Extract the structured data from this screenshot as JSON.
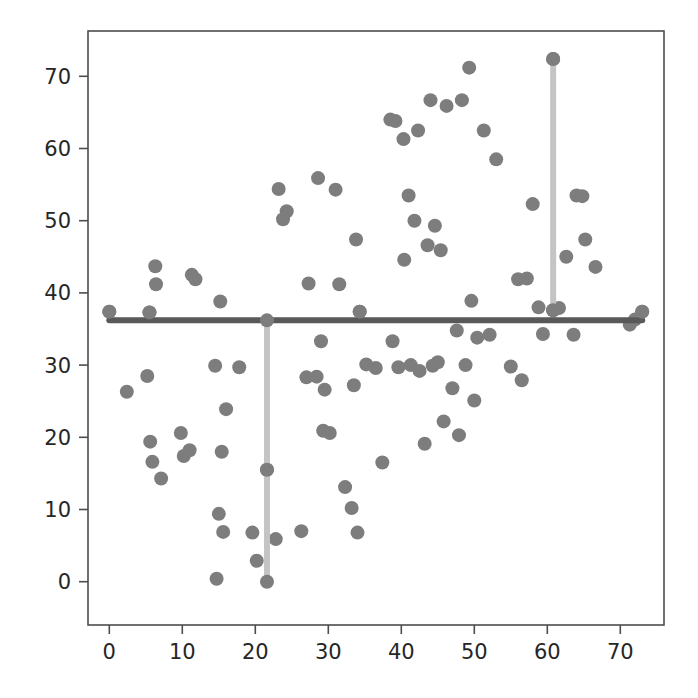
{
  "figure": {
    "background_color": "#ffffff",
    "width": 698,
    "height": 698
  },
  "chart_data": {
    "type": "scatter",
    "title": "",
    "xlabel": "",
    "ylabel": "",
    "xlim": [
      -2.9,
      76.0
    ],
    "ylim": [
      -5.0,
      71.4
    ],
    "grid": false,
    "legend": null,
    "axes": {
      "x_ticks": [
        0,
        10,
        20,
        30,
        40,
        50,
        60,
        70
      ],
      "x_tick_labels": [
        "0",
        "10",
        "20",
        "30",
        "40",
        "50",
        "60",
        "70"
      ],
      "y_ticks": [
        0,
        10,
        20,
        30,
        40,
        50,
        60,
        70
      ],
      "y_tick_labels": [
        "0",
        "10",
        "20",
        "30",
        "40",
        "50",
        "60",
        "70"
      ],
      "spine_color": "#4d4d4d",
      "tick_color": "#4d4d4d",
      "tick_label_color": "#262626"
    },
    "series": [
      {
        "name": "points",
        "marker": "circle",
        "marker_color": "#7d7d7d",
        "marker_size": 14,
        "points": [
          [
            0.0,
            37.4
          ],
          [
            2.4,
            26.3
          ],
          [
            5.2,
            28.5
          ],
          [
            5.5,
            37.3
          ],
          [
            5.6,
            19.4
          ],
          [
            5.9,
            16.6
          ],
          [
            6.3,
            43.7
          ],
          [
            6.4,
            41.2
          ],
          [
            7.1,
            14.3
          ],
          [
            9.8,
            20.6
          ],
          [
            10.2,
            17.4
          ],
          [
            11.0,
            18.2
          ],
          [
            11.3,
            42.5
          ],
          [
            11.8,
            41.9
          ],
          [
            14.5,
            29.9
          ],
          [
            14.7,
            0.4
          ],
          [
            15.0,
            9.4
          ],
          [
            15.2,
            38.8
          ],
          [
            15.4,
            18.0
          ],
          [
            15.6,
            6.9
          ],
          [
            16.0,
            23.9
          ],
          [
            17.8,
            29.7
          ],
          [
            19.6,
            6.8
          ],
          [
            20.2,
            2.9
          ],
          [
            21.6,
            15.5
          ],
          [
            22.8,
            5.9
          ],
          [
            23.2,
            54.4
          ],
          [
            23.8,
            50.2
          ],
          [
            24.3,
            51.3
          ],
          [
            26.3,
            7.0
          ],
          [
            27.0,
            28.3
          ],
          [
            27.3,
            41.3
          ],
          [
            28.4,
            28.4
          ],
          [
            28.6,
            55.9
          ],
          [
            29.0,
            33.3
          ],
          [
            29.3,
            20.9
          ],
          [
            29.5,
            26.6
          ],
          [
            30.2,
            20.6
          ],
          [
            31.0,
            54.3
          ],
          [
            31.5,
            41.2
          ],
          [
            32.3,
            13.1
          ],
          [
            33.2,
            10.2
          ],
          [
            33.5,
            27.2
          ],
          [
            33.8,
            47.4
          ],
          [
            34.0,
            6.8
          ],
          [
            34.3,
            37.4
          ],
          [
            35.2,
            30.1
          ],
          [
            36.5,
            29.6
          ],
          [
            37.4,
            16.5
          ],
          [
            38.5,
            64.0
          ],
          [
            38.8,
            33.3
          ],
          [
            39.2,
            63.8
          ],
          [
            39.6,
            29.7
          ],
          [
            40.3,
            61.3
          ],
          [
            40.4,
            44.6
          ],
          [
            41.0,
            53.5
          ],
          [
            41.3,
            30.0
          ],
          [
            41.8,
            50.0
          ],
          [
            42.3,
            62.5
          ],
          [
            42.5,
            29.2
          ],
          [
            43.2,
            19.1
          ],
          [
            43.6,
            46.6
          ],
          [
            44.0,
            66.7
          ],
          [
            44.3,
            29.9
          ],
          [
            44.6,
            49.3
          ],
          [
            45.0,
            30.4
          ],
          [
            45.4,
            45.9
          ],
          [
            45.8,
            22.2
          ],
          [
            46.2,
            65.9
          ],
          [
            47.0,
            26.8
          ],
          [
            47.6,
            34.8
          ],
          [
            47.9,
            20.3
          ],
          [
            48.3,
            66.7
          ],
          [
            48.8,
            30.0
          ],
          [
            49.3,
            71.2
          ],
          [
            49.6,
            38.9
          ],
          [
            50.0,
            25.1
          ],
          [
            50.4,
            33.8
          ],
          [
            51.3,
            62.5
          ],
          [
            52.1,
            34.2
          ],
          [
            53.0,
            58.5
          ],
          [
            55.0,
            29.8
          ],
          [
            56.0,
            41.9
          ],
          [
            56.5,
            27.9
          ],
          [
            57.2,
            42.0
          ],
          [
            58.0,
            52.3
          ],
          [
            58.8,
            38.0
          ],
          [
            59.4,
            34.3
          ],
          [
            60.8,
            72.4
          ],
          [
            60.8,
            37.6
          ],
          [
            61.6,
            37.9
          ],
          [
            62.6,
            45.0
          ],
          [
            63.6,
            34.2
          ],
          [
            64.0,
            53.5
          ],
          [
            64.8,
            53.4
          ],
          [
            65.2,
            47.4
          ],
          [
            66.6,
            43.6
          ],
          [
            71.3,
            35.6
          ],
          [
            72.0,
            36.3
          ],
          [
            73.0,
            37.4
          ]
        ]
      }
    ],
    "annotations": {
      "crosshair": {
        "horizontal_line": {
          "y": 36.2,
          "x_start": 0.0,
          "x_end": 73.0,
          "color": "#595959",
          "width": 6
        },
        "vertical_lines": [
          {
            "x": 21.6,
            "y_start": 0.0,
            "y_end": 36.2,
            "color": "#c4c4c4",
            "width": 6
          },
          {
            "x": 60.8,
            "y_start": 36.2,
            "y_end": 72.4,
            "color": "#c4c4c4",
            "width": 6
          }
        ],
        "node_markers": [
          [
            0.0,
            37.4
          ],
          [
            5.5,
            37.3
          ],
          [
            21.6,
            36.2
          ],
          [
            34.3,
            37.4
          ],
          [
            60.8,
            37.6
          ],
          [
            73.0,
            37.4
          ],
          [
            21.6,
            15.5
          ],
          [
            21.6,
            0.0
          ],
          [
            60.8,
            72.4
          ]
        ]
      }
    }
  }
}
